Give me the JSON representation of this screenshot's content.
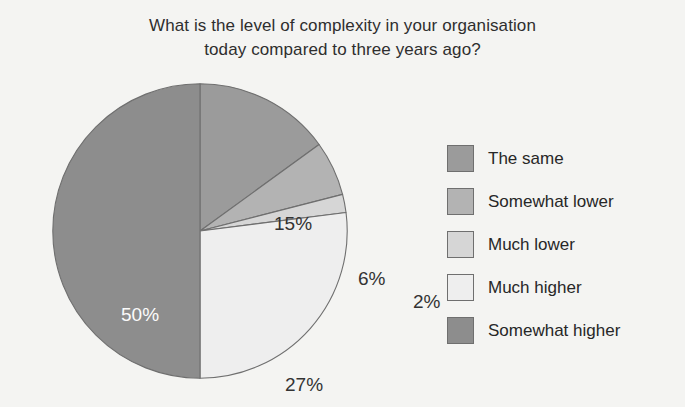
{
  "title": {
    "line1": "What is the level of complexity in your organisation",
    "line2": "today compared to three years ago?"
  },
  "chart_data": {
    "type": "pie",
    "title": "What is the level of complexity in your organisation today compared to three years ago?",
    "xlabel": "",
    "ylabel": "",
    "units": "percent",
    "start_angle_deg": 0,
    "direction": "clockwise",
    "legend_position": "right",
    "grid": false,
    "categories": [
      "The same",
      "Somewhat lower",
      "Much lower",
      "Much higher",
      "Somewhat higher"
    ],
    "values": [
      15,
      6,
      2,
      27,
      50
    ],
    "data_labels": [
      "15%",
      "6%",
      "2%",
      "27%",
      "50%"
    ],
    "colors": [
      "#9b9b9b",
      "#b3b3b3",
      "#d6d6d6",
      "#eeeeee",
      "#8d8d8d"
    ],
    "slices": [
      {
        "label": "The same",
        "value": 15,
        "display": "15%",
        "color": "#9b9b9b",
        "label_color": "#333333",
        "label_placement": "inside"
      },
      {
        "label": "Somewhat lower",
        "value": 6,
        "display": "6%",
        "color": "#b3b3b3",
        "label_color": "#333333",
        "label_placement": "inside"
      },
      {
        "label": "Much lower",
        "value": 2,
        "display": "2%",
        "color": "#d6d6d6",
        "label_color": "#333333",
        "label_placement": "outside"
      },
      {
        "label": "Much higher",
        "value": 27,
        "display": "27%",
        "color": "#eeeeee",
        "label_color": "#333333",
        "label_placement": "inside"
      },
      {
        "label": "Somewhat higher",
        "value": 50,
        "display": "50%",
        "color": "#8d8d8d",
        "label_color": "#fbfbfb",
        "label_placement": "inside"
      }
    ]
  },
  "legend": {
    "items": [
      {
        "label": "The same",
        "color": "#9b9b9b"
      },
      {
        "label": "Somewhat lower",
        "color": "#b3b3b3"
      },
      {
        "label": "Much lower",
        "color": "#d6d6d6"
      },
      {
        "label": "Much higher",
        "color": "#eeeeee"
      },
      {
        "label": "Somewhat higher",
        "color": "#8d8d8d"
      }
    ]
  },
  "style": {
    "background": "#f4f4f2",
    "slice_outline": "#6f6f6f",
    "text_color": "#2b2b2b"
  }
}
